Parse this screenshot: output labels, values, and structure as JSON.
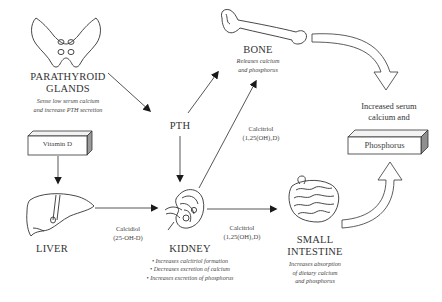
{
  "nodes": {
    "parathyroid": {
      "title_line1": "PARATHYROID",
      "title_line2": "GLANDS",
      "note_line1": "Sense low serum calcium",
      "note_line2": "and increase PTH secretion"
    },
    "vitamin_d": {
      "label": "Vitamin D"
    },
    "liver": {
      "title": "LIVER"
    },
    "pth": {
      "label": "PTH"
    },
    "bone": {
      "title": "BONE",
      "note_line1": "Releases calcium",
      "note_line2": "and phosphorus"
    },
    "kidney": {
      "title": "KIDNEY",
      "bullets": [
        "• Increases calcitriol formation",
        "• Decreases excretion of calcium",
        "• Increases excretion of phosphorus"
      ]
    },
    "small_intestine": {
      "title_line1": "SMALL",
      "title_line2": "INTESTINE",
      "note_line1": "Increases absorption",
      "note_line2": "of dietary calcium",
      "note_line3": "and phosphorus"
    },
    "outcome": {
      "line1": "Increased serum",
      "line2": "calcium and",
      "box_label": "Phosphorus"
    }
  },
  "edges": {
    "liver_to_kidney": {
      "line1": "Calcidiol",
      "line2": "(25-OH-D)"
    },
    "kidney_to_intestine": {
      "line1": "Calcitriol",
      "line2": "(1,25(OH)₂D)"
    },
    "kidney_to_bone": {
      "line1": "Calcitriol",
      "line2": "(1,25(OH)₂D)"
    }
  },
  "colors": {
    "line": "#2b2b2b",
    "text": "#3a3a3a",
    "background": "#ffffff"
  }
}
